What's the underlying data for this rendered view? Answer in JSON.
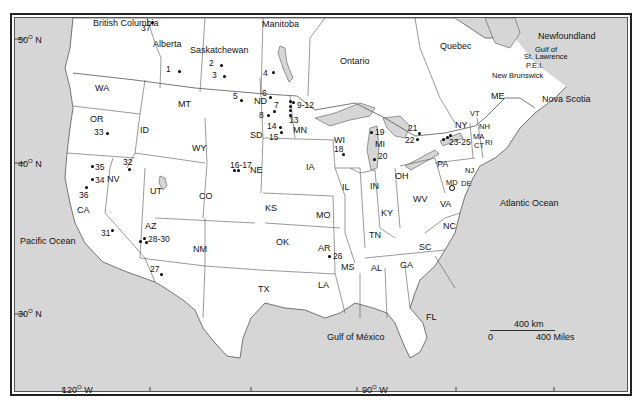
{
  "map": {
    "colors": {
      "land": "#ffffff",
      "water": "#d6d6d6",
      "border": "#555555",
      "frame": "#222222"
    },
    "latitude_labels": [
      {
        "text": "50",
        "suffix": "N",
        "x": 18,
        "y": 34
      },
      {
        "text": "40",
        "suffix": "N",
        "x": 18,
        "y": 158
      },
      {
        "text": "30",
        "suffix": "N",
        "x": 18,
        "y": 308
      }
    ],
    "longitude_labels": [
      {
        "text": "120",
        "suffix": "W",
        "x": 62,
        "y": 385
      },
      {
        "text": "90",
        "suffix": "W",
        "x": 362,
        "y": 383
      }
    ],
    "regions": {
      "canada": [
        "British Columbia",
        "Alberta",
        "Saskatchewan",
        "Manitoba",
        "Ontario",
        "Quebec",
        "Newfoundland",
        "New Brunswick",
        "Nova Scotia",
        "P.E.I."
      ],
      "us_states": [
        "WA",
        "OR",
        "ID",
        "MT",
        "WY",
        "CA",
        "NV",
        "UT",
        "CO",
        "AZ",
        "NM",
        "ND",
        "SD",
        "NE",
        "KS",
        "OK",
        "TX",
        "MN",
        "IA",
        "MO",
        "AR",
        "LA",
        "WI",
        "IL",
        "MI",
        "IN",
        "OH",
        "KY",
        "TN",
        "MS",
        "AL",
        "GA",
        "FL",
        "SC",
        "NC",
        "VA",
        "WV",
        "PA",
        "NY",
        "VT",
        "NH",
        "ME",
        "MA",
        "CT",
        "RI",
        "NJ",
        "DE",
        "MD"
      ]
    },
    "water_labels": {
      "pacific": "Pacific Ocean",
      "atlantic": "Atlantic Ocean",
      "gulf_mexico": "Gulf of México",
      "gulf_st_lawrence_1": "Gulf of",
      "gulf_st_lawrence_2": "St. Lawrence"
    },
    "site_labels": [
      "1",
      "2",
      "3",
      "4",
      "5",
      "6",
      "7",
      "8",
      "9-12",
      "13",
      "14",
      "15",
      "16-17",
      "18",
      "19",
      "20",
      "21",
      "22",
      "23-25",
      "26",
      "27",
      "28-30",
      "31",
      "32",
      "33",
      "34",
      "35",
      "36",
      "37"
    ],
    "scale": {
      "km_label": "400 km",
      "zero_label": "0",
      "miles_label": "400 Miles"
    }
  }
}
